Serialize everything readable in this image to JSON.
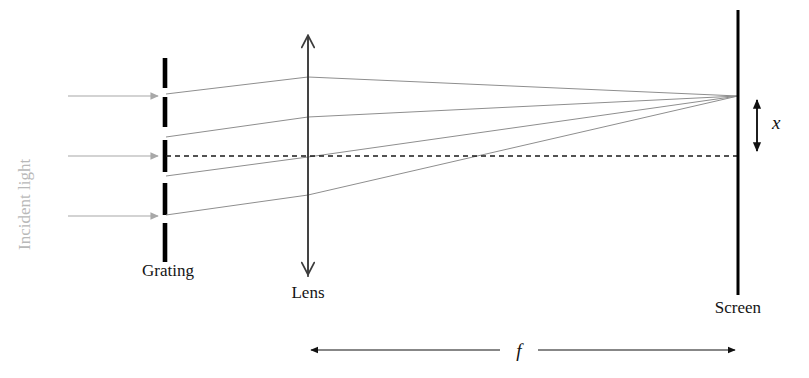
{
  "figure": {
    "background_color": "#ffffff"
  },
  "labels": {
    "incident_light": "Incident light",
    "grating": "Grating",
    "lens": "Lens",
    "screen": "Screen",
    "focal_length": "f",
    "displacement": "x"
  },
  "colors": {
    "ray": "#8e8e8e",
    "incident_ray": "#a8a8a8",
    "grating_bar": "#000000",
    "screen": "#000000",
    "axis": "#1a1a1a",
    "lens": "#3c3c3c",
    "label_text": "#141414",
    "incident_label_text": "#b9b9b9"
  },
  "geometry": {
    "width": 809,
    "height": 378,
    "optical_axis_y": 156,
    "grating_x": 165,
    "lens_x": 308,
    "screen_x": 738,
    "focus_y": 96,
    "screen_top_y": 10,
    "screen_bottom_y": 295,
    "lens_top_y": 33,
    "lens_bottom_y": 277,
    "focal_arrow_y": 350
  },
  "grating_bars": [
    {
      "name": "bar-1",
      "y1": 58,
      "y2": 88
    },
    {
      "name": "bar-2",
      "y1": 97,
      "y2": 127
    },
    {
      "name": "bar-3",
      "y1": 140,
      "y2": 172
    },
    {
      "name": "bar-4",
      "y1": 183,
      "y2": 215
    },
    {
      "name": "bar-5",
      "y1": 223,
      "y2": 262
    }
  ],
  "incident_rays": [
    {
      "name": "incident-ray-top",
      "x1": 68,
      "x2": 160,
      "y": 96
    },
    {
      "name": "incident-ray-middle",
      "x1": 68,
      "x2": 160,
      "y": 156
    },
    {
      "name": "incident-ray-bottom",
      "x1": 68,
      "x2": 160,
      "y": 216
    }
  ],
  "diffracted_rays": [
    {
      "name": "diffracted-ray-order-plus2",
      "grating_y": 94,
      "lens_y": 77,
      "screen_y": 96
    },
    {
      "name": "diffracted-ray-order-plus1",
      "grating_y": 137,
      "lens_y": 117,
      "screen_y": 96
    },
    {
      "name": "diffracted-ray-order-zero",
      "grating_y": 176,
      "lens_y": 157,
      "screen_y": 96
    },
    {
      "name": "diffracted-ray-order-minus1",
      "grating_y": 215,
      "lens_y": 195,
      "screen_y": 96
    }
  ],
  "displacement_marker": {
    "x": 757,
    "y_top": 96,
    "y_bottom": 155,
    "label_x": 772,
    "label_y": 129
  },
  "focal_marker": {
    "x_start": 308,
    "x_end": 738,
    "y": 350,
    "label_x": 520,
    "label_y": 357,
    "gap_left": 500,
    "gap_right": 538
  },
  "label_positions": {
    "incident_light": {
      "x": 30,
      "y": 250
    },
    "grating": {
      "x": 168,
      "y": 276
    },
    "lens": {
      "x": 308,
      "y": 298
    },
    "screen": {
      "x": 738,
      "y": 313
    }
  }
}
